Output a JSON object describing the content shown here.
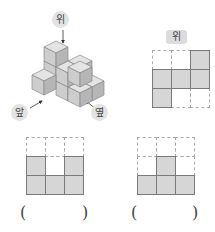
{
  "figure": {
    "labels": {
      "top": "위",
      "front": "앞",
      "side": "옆"
    },
    "top_view": {
      "label": "위",
      "rows": [
        [
          0,
          0,
          1
        ],
        [
          1,
          1,
          1
        ],
        [
          1,
          0,
          0
        ]
      ]
    },
    "answer_views": [
      {
        "rows": [
          [
            0,
            0,
            0
          ],
          [
            1,
            0,
            1
          ],
          [
            1,
            1,
            1
          ]
        ],
        "answer_open": "(",
        "answer_close": ")"
      },
      {
        "rows": [
          [
            0,
            0,
            0
          ],
          [
            0,
            1,
            0
          ],
          [
            1,
            1,
            1
          ]
        ],
        "answer_open": "(",
        "answer_close": ")"
      }
    ],
    "colors": {
      "cube_top": "#e4e4e4",
      "cube_left": "#c9c9c9",
      "cube_right": "#b3b3b3",
      "cell_filled": "#d6d6d6",
      "cell_border": "#7a7a7a",
      "dashed": "#a8a8a8",
      "label_bg": "#e3e3e3"
    }
  }
}
